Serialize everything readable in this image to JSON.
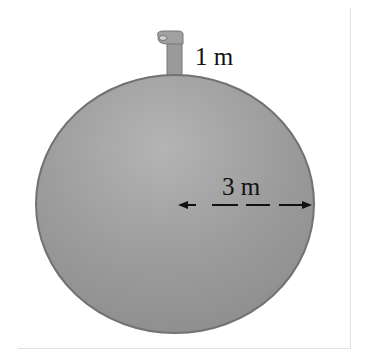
{
  "figure": {
    "labels": {
      "pipe_height": "1 m",
      "radius": "3 m"
    },
    "colors": {
      "sphere_fill": "#9a9a9a",
      "sphere_highlight": "#b4b4b4",
      "sphere_edge": "#6e6e6e",
      "arrow": "#111111",
      "frame": "#e2e2e2"
    }
  }
}
